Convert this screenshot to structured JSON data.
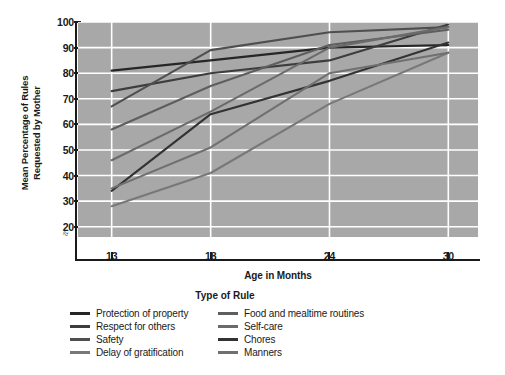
{
  "chart_data": {
    "type": "line",
    "title": "",
    "xlabel": "Age in Months",
    "ylabel": "Mean Percentage of Rules Requested by Mother",
    "x": [
      13,
      18,
      24,
      30
    ],
    "xticklabels": [
      "13",
      "18",
      "24",
      "30"
    ],
    "yticklabels": [
      "20",
      "30",
      "40",
      "50",
      "60",
      "70",
      "80",
      "90",
      "100"
    ],
    "ylim": [
      16,
      100
    ],
    "xlim": [
      11.3,
      31.5
    ],
    "grid": true,
    "legend_position": "below",
    "legend_title": "Type of Rule",
    "plot_background": "#a8a8a8",
    "grid_color": "#ffffff",
    "series": [
      {
        "name": "Protection of property",
        "color": "#262626",
        "values": [
          81,
          85,
          90,
          91
        ]
      },
      {
        "name": "Respect for others",
        "color": "#3d3d3d",
        "values": [
          73,
          80,
          85,
          99
        ]
      },
      {
        "name": "Safety",
        "color": "#4f4f4f",
        "values": [
          67,
          89,
          96,
          98
        ]
      },
      {
        "name": "Delay of gratification",
        "color": "#787878",
        "values": [
          28,
          41,
          68,
          88
        ]
      },
      {
        "name": "Food and mealtime routines",
        "color": "#5e5e5e",
        "values": [
          58,
          75,
          91,
          97
        ]
      },
      {
        "name": "Self-care",
        "color": "#6b6b6b",
        "values": [
          46,
          65,
          90,
          98
        ]
      },
      {
        "name": "Chores",
        "color": "#333333",
        "values": [
          34,
          64,
          77,
          92
        ]
      },
      {
        "name": "Manners",
        "color": "#707070",
        "values": [
          35,
          51,
          80,
          88
        ]
      }
    ]
  },
  "axis": {
    "ytick_labels": [
      "100",
      "90",
      "80",
      "70",
      "60",
      "50",
      "40",
      "30",
      "20"
    ],
    "xtick_labels": [
      "13",
      "18",
      "24",
      "30"
    ],
    "xtitle": "Age in Months",
    "ytitle_line1": "Mean Percentage of Rules",
    "ytitle_line2": "Requested by Mother",
    "break_glyph": "≈"
  },
  "legend": {
    "title": "Type of Rule",
    "columns": [
      [
        {
          "label": "Protection of property",
          "color": "#262626"
        },
        {
          "label": "Respect for others",
          "color": "#3d3d3d"
        },
        {
          "label": "Safety",
          "color": "#4f4f4f"
        },
        {
          "label": "Delay of gratification",
          "color": "#787878"
        }
      ],
      [
        {
          "label": "Food and mealtime routines",
          "color": "#5e5e5e"
        },
        {
          "label": "Self-care",
          "color": "#6b6b6b"
        },
        {
          "label": "Chores",
          "color": "#333333"
        },
        {
          "label": "Manners",
          "color": "#707070"
        }
      ]
    ]
  }
}
